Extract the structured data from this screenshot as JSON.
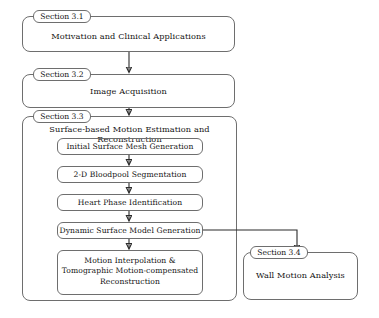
{
  "diagram": {
    "line_color": "#6e6e6e",
    "arrow_color": "#2b2b2b",
    "text_color": "#141414",
    "background": "#ffffff"
  },
  "sections": [
    {
      "tag": "Section 3.1",
      "heading": "Motivation and Clinical Applications",
      "steps": []
    },
    {
      "tag": "Section 3.2",
      "heading": "Image Acquisition",
      "steps": []
    },
    {
      "tag": "Section 3.3",
      "heading": "Surface-based Motion Estimation and Reconstruction",
      "steps": [
        "Initial Surface Mesh Generation",
        "2-D Bloodpool Segmentation",
        "Heart Phase Identification",
        "Dynamic Surface Model Generation",
        "Motion Interpolation &\nTomographic Motion-compensated\nReconstruction"
      ]
    },
    {
      "tag": "Section 3.4",
      "heading": "Wall Motion Analysis",
      "steps": []
    }
  ],
  "connectors": [
    {
      "name": "arrow-3-1-to-3-2",
      "from": "Section 3.1",
      "to": "Section 3.2"
    },
    {
      "name": "arrow-3-2-to-3-3",
      "from": "Section 3.2",
      "to": "Section 3.3"
    },
    {
      "name": "arrow-mesh-to-bloodpool",
      "from": "Initial Surface Mesh Generation",
      "to": "2-D Bloodpool Segmentation"
    },
    {
      "name": "arrow-bloodpool-to-phase",
      "from": "2-D Bloodpool Segmentation",
      "to": "Heart Phase Identification"
    },
    {
      "name": "arrow-phase-to-dynamic",
      "from": "Heart Phase Identification",
      "to": "Dynamic Surface Model Generation"
    },
    {
      "name": "arrow-dynamic-to-reconstruction",
      "from": "Dynamic Surface Model Generation",
      "to": "Motion Interpolation & Tomographic Motion-compensated Reconstruction"
    },
    {
      "name": "arrow-dynamic-to-wall-motion",
      "from": "Dynamic Surface Model Generation",
      "to": "Section 3.4"
    }
  ]
}
